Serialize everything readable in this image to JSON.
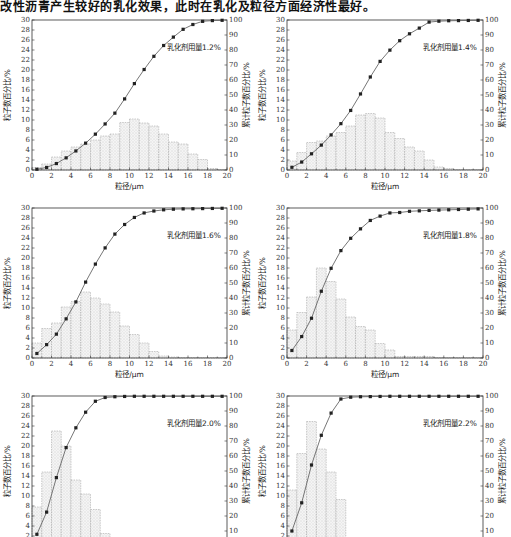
{
  "header": {
    "text": "改性沥青产生较好的乳化效果，此时在乳化及粒径方面经济性最好。"
  },
  "chart_data": [
    {
      "type": "bar",
      "title": "乳化剂用量1.2%",
      "legend_text": "乳化剂用量1.2%",
      "xlabel": "粒径/μm",
      "ylabel": "粒子数百分比/%",
      "y2label": "累计粒子数百分比/%",
      "xlim": [
        0,
        20
      ],
      "ylim": [
        0,
        30
      ],
      "y2lim": [
        0,
        100
      ],
      "x_ticks": [
        "0",
        "2",
        "4",
        "6",
        "8",
        "10",
        "12",
        "14",
        "16",
        "18",
        "20"
      ],
      "y_ticks": [
        "0",
        "2",
        "4",
        "6",
        "8",
        "10",
        "12",
        "14",
        "16",
        "18",
        "20",
        "22",
        "24",
        "26",
        "28",
        "30"
      ],
      "y2_ticks": [
        "0",
        "10",
        "20",
        "30",
        "40",
        "50",
        "60",
        "70",
        "80",
        "90",
        "100"
      ],
      "bins": [
        0,
        1,
        2,
        3,
        4,
        5,
        6,
        7,
        8,
        9,
        10,
        11,
        12,
        13,
        14,
        15,
        16,
        17,
        18,
        19
      ],
      "values": [
        0.5,
        1.2,
        2.6,
        3.8,
        4.6,
        5.2,
        6.0,
        6.8,
        7.2,
        9.5,
        10.2,
        9.4,
        8.8,
        7.2,
        5.6,
        5.2,
        3.2,
        2.1,
        0.3,
        0.1
      ],
      "cumulative_x": [
        0.5,
        1.5,
        2.5,
        3.5,
        4.5,
        5.5,
        6.5,
        7.5,
        8.5,
        9.5,
        10.5,
        11.5,
        12.5,
        13.5,
        14.5,
        15.5,
        16.5,
        17.5,
        18.5,
        19.5
      ],
      "cumulative": [
        0.5,
        1.7,
        4.3,
        8.1,
        12.7,
        17.9,
        23.9,
        30.7,
        37.9,
        47.4,
        57.6,
        67.0,
        75.8,
        83.0,
        88.6,
        93.8,
        97.0,
        99.1,
        99.6,
        99.8
      ]
    },
    {
      "type": "bar",
      "title": "乳化剂用量1.4%",
      "legend_text": "乳化剂用量1.4%",
      "xlabel": "粒径/μm",
      "ylabel": "粒子数百分比/%",
      "y2label": "累计粒子数百分比/%",
      "xlim": [
        0,
        20
      ],
      "ylim": [
        0,
        30
      ],
      "y2lim": [
        0,
        100
      ],
      "x_ticks": [
        "0",
        "2",
        "4",
        "6",
        "8",
        "10",
        "12",
        "14",
        "16",
        "18",
        "20"
      ],
      "y_ticks": [
        "0",
        "2",
        "4",
        "6",
        "8",
        "10",
        "12",
        "14",
        "16",
        "18",
        "20",
        "22",
        "24",
        "26",
        "28",
        "30"
      ],
      "y2_ticks": [
        "0",
        "10",
        "20",
        "30",
        "40",
        "50",
        "60",
        "70",
        "80",
        "90",
        "100"
      ],
      "bins": [
        0,
        1,
        2,
        3,
        4,
        5,
        6,
        7,
        8,
        9,
        10,
        11,
        12,
        13,
        14,
        15,
        16,
        17,
        18,
        19
      ],
      "values": [
        1.8,
        3.5,
        5.5,
        5.8,
        6.8,
        7.5,
        8.8,
        11.0,
        11.3,
        10.4,
        7.5,
        6.3,
        4.6,
        3.8,
        2.0,
        0.6,
        0.3,
        0.1,
        0.1,
        0.1
      ],
      "cumulative_x": [
        0.5,
        1.5,
        2.5,
        3.5,
        4.5,
        5.5,
        6.5,
        7.5,
        8.5,
        9.5,
        10.5,
        11.5,
        12.5,
        13.5,
        14.5,
        15.5,
        16.5,
        17.5,
        18.5,
        19.5
      ],
      "cumulative": [
        1.8,
        5.3,
        10.8,
        16.6,
        23.4,
        30.9,
        39.7,
        50.7,
        62.0,
        72.4,
        79.9,
        86.2,
        90.8,
        94.6,
        98.6,
        99.2,
        99.5,
        99.6,
        99.7,
        99.8
      ]
    },
    {
      "type": "bar",
      "title": "乳化剂用量1.6%",
      "legend_text": "乳化剂用量1.6%",
      "xlabel": "粒径/μm",
      "ylabel": "粒子数百分比/%",
      "y2label": "累计粒子数百分比/%",
      "xlim": [
        0,
        20
      ],
      "ylim": [
        0,
        30
      ],
      "y2lim": [
        0,
        100
      ],
      "x_ticks": [
        "0",
        "2",
        "4",
        "6",
        "8",
        "10",
        "12",
        "14",
        "16",
        "18",
        "20"
      ],
      "y_ticks": [
        "0",
        "2",
        "4",
        "6",
        "8",
        "10",
        "12",
        "14",
        "16",
        "18",
        "20",
        "22",
        "24",
        "26",
        "28",
        "30"
      ],
      "y2_ticks": [
        "0",
        "10",
        "20",
        "30",
        "40",
        "50",
        "60",
        "70",
        "80",
        "90",
        "100"
      ],
      "bins": [
        0,
        1,
        2,
        3,
        4,
        5,
        6,
        7,
        8,
        9,
        10,
        11,
        12,
        13,
        14,
        15,
        16,
        17,
        18,
        19
      ],
      "values": [
        3.0,
        5.9,
        7.0,
        10.2,
        11.3,
        13.2,
        12.0,
        10.8,
        9.2,
        6.4,
        4.7,
        3.0,
        1.3,
        0.4,
        0.2,
        0.1,
        0.1,
        0.1,
        0.1,
        0.1
      ],
      "cumulative_x": [
        0.5,
        1.5,
        2.5,
        3.5,
        4.5,
        5.5,
        6.5,
        7.5,
        8.5,
        9.5,
        10.5,
        11.5,
        12.5,
        13.5,
        14.5,
        15.5,
        16.5,
        17.5,
        18.5,
        19.5
      ],
      "cumulative": [
        3.0,
        8.9,
        15.9,
        26.1,
        37.4,
        50.6,
        62.6,
        73.4,
        82.6,
        89.0,
        93.7,
        96.7,
        98.0,
        98.8,
        99.2,
        99.4,
        99.5,
        99.6,
        99.7,
        99.8
      ]
    },
    {
      "type": "bar",
      "title": "乳化剂用量1.8%",
      "legend_text": "乳化剂用量1.8%",
      "xlabel": "粒径/μm",
      "ylabel": "粒子数百分比/%",
      "y2label": "累计粒子数百分比/%",
      "xlim": [
        0,
        20
      ],
      "ylim": [
        0,
        30
      ],
      "y2lim": [
        0,
        100
      ],
      "x_ticks": [
        "0",
        "2",
        "4",
        "6",
        "8",
        "10",
        "12",
        "14",
        "16",
        "18",
        "20"
      ],
      "y_ticks": [
        "0",
        "2",
        "4",
        "6",
        "8",
        "10",
        "12",
        "14",
        "16",
        "18",
        "20",
        "22",
        "24",
        "26",
        "28",
        "30"
      ],
      "y2_ticks": [
        "0",
        "10",
        "20",
        "30",
        "40",
        "50",
        "60",
        "70",
        "80",
        "90",
        "100"
      ],
      "bins": [
        0,
        1,
        2,
        3,
        4,
        5,
        6,
        7,
        8,
        9,
        10,
        11,
        12,
        13,
        14,
        15,
        16,
        17,
        18,
        19
      ],
      "values": [
        5.6,
        9.1,
        12.2,
        18.0,
        15.3,
        11.8,
        8.2,
        6.3,
        5.6,
        2.9,
        1.6,
        0.3,
        0.3,
        0.3,
        0.3,
        0.1,
        0.1,
        0.1,
        0.1,
        0.1
      ],
      "cumulative_x": [
        0.5,
        1.5,
        2.5,
        3.5,
        4.5,
        5.5,
        6.5,
        7.5,
        8.5,
        9.5,
        10.5,
        11.5,
        12.5,
        13.5,
        14.5,
        15.5,
        16.5,
        17.5,
        18.5,
        19.5
      ],
      "cumulative": [
        5.0,
        14.3,
        26.5,
        44.5,
        59.8,
        71.6,
        79.8,
        86.1,
        91.7,
        94.6,
        96.7,
        97.0,
        97.8,
        98.1,
        98.4,
        98.6,
        98.8,
        99.0,
        99.2,
        99.4
      ]
    },
    {
      "type": "bar",
      "title": "乳化剂用量2.0%",
      "legend_text": "乳化剂用量2.0%",
      "xlabel": "粒径/μm",
      "ylabel": "粒子数百分比/%",
      "y2label": "累计粒子数百分比/%",
      "xlim": [
        0,
        20
      ],
      "ylim": [
        0,
        30
      ],
      "y2lim": [
        0,
        100
      ],
      "y_ticks": [
        "2",
        "4",
        "6",
        "8",
        "10",
        "12",
        "14",
        "16",
        "18",
        "20",
        "22",
        "24",
        "26",
        "28",
        "30"
      ],
      "y2_ticks": [
        "10",
        "20",
        "30",
        "40",
        "50",
        "60",
        "70",
        "80",
        "90",
        "100"
      ],
      "bins": [
        0,
        1,
        2,
        3,
        4,
        5,
        6,
        7,
        8,
        9,
        10,
        11,
        12,
        13,
        14,
        15,
        16,
        17,
        18,
        19
      ],
      "values": [
        7.8,
        14.8,
        23.0,
        20.0,
        13.2,
        10.4,
        7.3,
        2.5,
        0.5,
        0.2,
        0.1,
        0.1,
        0.1,
        0.1,
        0.1,
        0.1,
        0.1,
        0.1,
        0.1,
        0.1
      ],
      "cumulative_x": [
        0.5,
        1.5,
        2.5,
        3.5,
        4.5,
        5.5,
        6.5,
        7.5,
        8.5,
        9.5,
        10.5,
        11.5,
        12.5,
        13.5,
        14.5,
        15.5,
        16.5,
        17.5,
        18.5,
        19.5
      ],
      "cumulative": [
        7.8,
        22.6,
        45.6,
        65.6,
        78.8,
        89.2,
        96.5,
        99.0,
        99.5,
        99.7,
        99.8,
        99.8,
        99.8,
        99.8,
        99.8,
        99.8,
        99.8,
        99.8,
        99.8,
        99.8
      ]
    },
    {
      "type": "bar",
      "title": "乳化剂用量2.2%",
      "legend_text": "乳化剂用量2.2%",
      "xlabel": "粒径/μm",
      "ylabel": "粒子数百分比/%",
      "y2label": "累计粒子数百分比/%",
      "xlim": [
        0,
        20
      ],
      "ylim": [
        0,
        30
      ],
      "y2lim": [
        0,
        100
      ],
      "y_ticks": [
        "2",
        "4",
        "6",
        "8",
        "10",
        "12",
        "14",
        "16",
        "18",
        "20",
        "22",
        "24",
        "26",
        "28",
        "30"
      ],
      "y2_ticks": [
        "10",
        "20",
        "30",
        "40",
        "50",
        "60",
        "70",
        "80",
        "90",
        "100"
      ],
      "bins": [
        0,
        1,
        2,
        3,
        4,
        5,
        6,
        7,
        8,
        9,
        10,
        11,
        12,
        13,
        14,
        15,
        16,
        17,
        18,
        19
      ],
      "values": [
        11.2,
        18.5,
        24.9,
        19.4,
        14.8,
        9.3,
        0.5,
        0.2,
        0.1,
        0.1,
        0.1,
        0.1,
        0.1,
        0.1,
        0.1,
        0.1,
        0.1,
        0.1,
        0.1,
        0.1
      ],
      "cumulative_x": [
        0.5,
        1.5,
        2.5,
        3.5,
        4.5,
        5.5,
        6.5,
        7.5,
        8.5,
        9.5,
        10.5,
        11.5,
        12.5,
        13.5,
        14.5,
        15.5,
        16.5,
        17.5,
        18.5,
        19.5
      ],
      "cumulative": [
        10.0,
        28.8,
        54.0,
        73.8,
        88.6,
        98.0,
        99.2,
        99.5,
        99.6,
        99.7,
        99.8,
        99.8,
        99.8,
        99.8,
        99.8,
        99.8,
        99.8,
        99.8,
        99.8,
        99.8
      ]
    }
  ]
}
